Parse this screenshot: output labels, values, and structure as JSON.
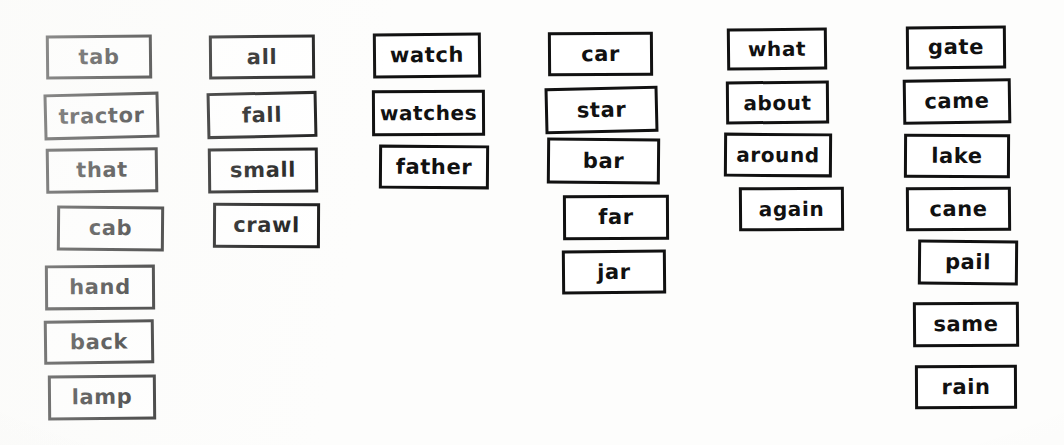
{
  "worksheet": {
    "title": "Word Card Sort Worksheet",
    "background_color": "#fdfdfc",
    "ink_color": "#111111",
    "card_fill_color": "#ffffff",
    "columns": [
      {
        "name": "column-1",
        "left": 44,
        "cards": [
          {
            "text": "tab",
            "x": 46,
            "y": 35,
            "w": 106,
            "h": 44,
            "rot": -0.6,
            "fs": 21,
            "skew": 0
          },
          {
            "text": "tractor",
            "x": 44,
            "y": 93,
            "w": 115,
            "h": 46,
            "rot": -1.4,
            "fs": 21,
            "skew": 0
          },
          {
            "text": "that",
            "x": 46,
            "y": 148,
            "w": 112,
            "h": 45,
            "rot": -0.8,
            "fs": 21,
            "skew": 0
          },
          {
            "text": "cab",
            "x": 57,
            "y": 206,
            "w": 107,
            "h": 45,
            "rot": 0.5,
            "fs": 21,
            "skew": 0
          },
          {
            "text": "hand",
            "x": 45,
            "y": 265,
            "w": 110,
            "h": 45,
            "rot": -0.4,
            "fs": 21,
            "skew": 0
          },
          {
            "text": "back",
            "x": 44,
            "y": 320,
            "w": 110,
            "h": 44,
            "rot": -0.7,
            "fs": 21,
            "skew": 0
          },
          {
            "text": "lamp",
            "x": 48,
            "y": 375,
            "w": 108,
            "h": 45,
            "rot": -0.5,
            "fs": 21,
            "skew": 0
          }
        ]
      },
      {
        "name": "column-2",
        "left": 207,
        "cards": [
          {
            "text": "all",
            "x": 209,
            "y": 35,
            "w": 106,
            "h": 44,
            "rot": -0.5,
            "fs": 21,
            "skew": 0
          },
          {
            "text": "fall",
            "x": 207,
            "y": 92,
            "w": 110,
            "h": 46,
            "rot": -1.2,
            "fs": 21,
            "skew": 0
          },
          {
            "text": "small",
            "x": 208,
            "y": 148,
            "w": 110,
            "h": 45,
            "rot": -0.6,
            "fs": 21,
            "skew": 0
          },
          {
            "text": "crawl",
            "x": 213,
            "y": 203,
            "w": 107,
            "h": 45,
            "rot": 0.3,
            "fs": 21,
            "skew": 0
          }
        ]
      },
      {
        "name": "column-3",
        "left": 372,
        "cards": [
          {
            "text": "watch",
            "x": 373,
            "y": 33,
            "w": 108,
            "h": 45,
            "rot": -0.5,
            "fs": 21,
            "skew": 0
          },
          {
            "text": "watches",
            "x": 372,
            "y": 90,
            "w": 113,
            "h": 46,
            "rot": -0.3,
            "fs": 20,
            "skew": 0
          },
          {
            "text": "father",
            "x": 379,
            "y": 145,
            "w": 110,
            "h": 44,
            "rot": 0.4,
            "fs": 21,
            "skew": 0
          }
        ]
      },
      {
        "name": "column-4",
        "left": 545,
        "cards": [
          {
            "text": "car",
            "x": 548,
            "y": 32,
            "w": 105,
            "h": 44,
            "rot": -0.4,
            "fs": 21,
            "skew": 0
          },
          {
            "text": "star",
            "x": 545,
            "y": 87,
            "w": 113,
            "h": 46,
            "rot": -1.3,
            "fs": 21,
            "skew": 0
          },
          {
            "text": "bar",
            "x": 547,
            "y": 138,
            "w": 113,
            "h": 46,
            "rot": 0.5,
            "fs": 21,
            "skew": 0
          },
          {
            "text": "far",
            "x": 563,
            "y": 195,
            "w": 106,
            "h": 45,
            "rot": -0.3,
            "fs": 21,
            "skew": 0
          },
          {
            "text": "jar",
            "x": 562,
            "y": 250,
            "w": 104,
            "h": 44,
            "rot": -0.5,
            "fs": 21,
            "skew": 0
          }
        ]
      },
      {
        "name": "column-5",
        "left": 725,
        "cards": [
          {
            "text": "what",
            "x": 727,
            "y": 28,
            "w": 100,
            "h": 42,
            "rot": -0.6,
            "fs": 20,
            "skew": 0
          },
          {
            "text": "about",
            "x": 726,
            "y": 81,
            "w": 103,
            "h": 43,
            "rot": -0.5,
            "fs": 20,
            "skew": 0
          },
          {
            "text": "around",
            "x": 724,
            "y": 133,
            "w": 108,
            "h": 44,
            "rot": 0.4,
            "fs": 20,
            "skew": 0
          },
          {
            "text": "again",
            "x": 739,
            "y": 187,
            "w": 105,
            "h": 44,
            "rot": -0.4,
            "fs": 20,
            "skew": 0
          }
        ]
      },
      {
        "name": "column-6",
        "left": 903,
        "cards": [
          {
            "text": "gate",
            "x": 906,
            "y": 26,
            "w": 100,
            "h": 43,
            "rot": -0.5,
            "fs": 21,
            "skew": 0
          },
          {
            "text": "came",
            "x": 903,
            "y": 79,
            "w": 108,
            "h": 45,
            "rot": -0.8,
            "fs": 21,
            "skew": 0
          },
          {
            "text": "lake",
            "x": 904,
            "y": 134,
            "w": 106,
            "h": 44,
            "rot": 0.3,
            "fs": 21,
            "skew": 0
          },
          {
            "text": "cane",
            "x": 906,
            "y": 187,
            "w": 105,
            "h": 44,
            "rot": -0.4,
            "fs": 21,
            "skew": 0
          },
          {
            "text": "pail",
            "x": 918,
            "y": 240,
            "w": 100,
            "h": 45,
            "rot": 0.5,
            "fs": 21,
            "skew": 0
          },
          {
            "text": "same",
            "x": 913,
            "y": 302,
            "w": 106,
            "h": 45,
            "rot": -0.4,
            "fs": 21,
            "skew": 0
          },
          {
            "text": "rain",
            "x": 915,
            "y": 365,
            "w": 102,
            "h": 44,
            "rot": -0.3,
            "fs": 21,
            "skew": 0
          }
        ]
      }
    ]
  }
}
